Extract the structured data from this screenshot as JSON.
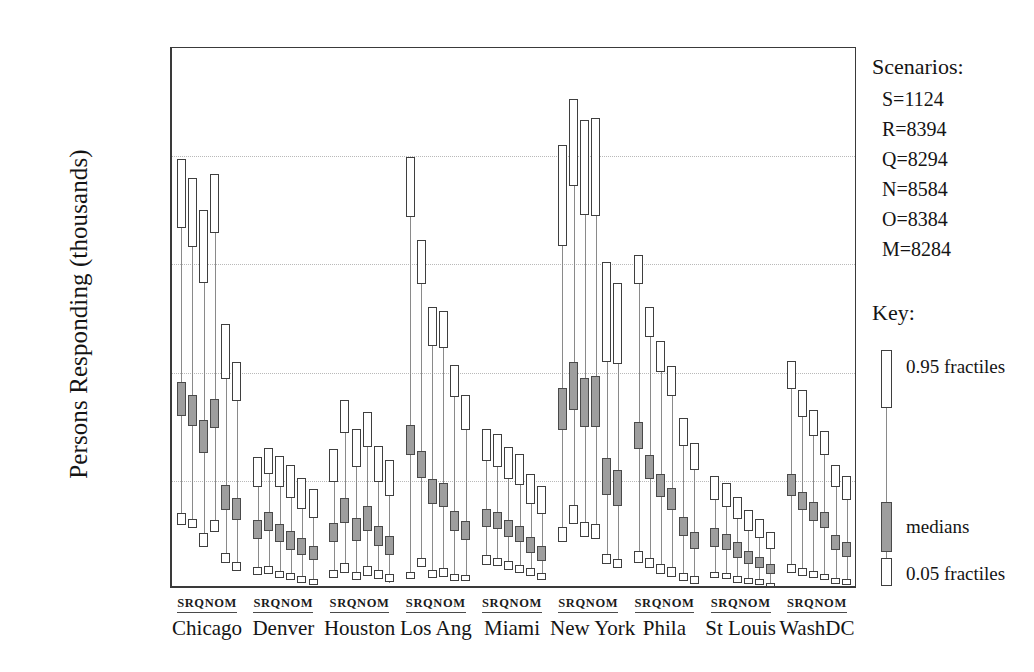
{
  "chart_data": {
    "type": "box",
    "title": "",
    "xlabel": "",
    "ylabel": "Persons Responding (thousands)",
    "ylim": [
      0,
      50
    ],
    "yticks": [
      0,
      10,
      20,
      30,
      40,
      50
    ],
    "gridlines": [
      10,
      20,
      30,
      40
    ],
    "grid": true,
    "legend_position": "right",
    "scenario_codes": [
      "S",
      "R",
      "Q",
      "N",
      "O",
      "M"
    ],
    "categories": [
      "Chicago",
      "Denver",
      "Houston",
      "Los Ang",
      "Miami",
      "New York",
      "Phila",
      "St Louis",
      "WashDC"
    ],
    "value_keys": [
      "p05_low",
      "p05_high",
      "median_low",
      "median_high",
      "p95_low",
      "p95_high"
    ],
    "series": [
      {
        "name": "Chicago",
        "points": [
          {
            "scenario": "S",
            "p05_low": 5.9,
            "p05_high": 7.0,
            "median_low": 16.0,
            "median_high": 19.1,
            "p95_low": 33.4,
            "p95_high": 39.7
          },
          {
            "scenario": "R",
            "p05_low": 5.6,
            "p05_high": 6.5,
            "median_low": 15.1,
            "median_high": 17.9,
            "p95_low": 31.6,
            "p95_high": 38.0
          },
          {
            "scenario": "Q",
            "p05_low": 3.9,
            "p05_high": 5.2,
            "median_low": 12.6,
            "median_high": 15.6,
            "p95_low": 28.3,
            "p95_high": 35.0
          },
          {
            "scenario": "N",
            "p05_low": 5.3,
            "p05_high": 6.4,
            "median_low": 14.9,
            "median_high": 17.6,
            "p95_low": 32.9,
            "p95_high": 38.4
          },
          {
            "scenario": "O",
            "p05_low": 2.4,
            "p05_high": 3.3,
            "median_low": 7.3,
            "median_high": 9.6,
            "p95_low": 19.4,
            "p95_high": 24.5
          },
          {
            "scenario": "M",
            "p05_low": 1.7,
            "p05_high": 2.5,
            "median_low": 6.4,
            "median_high": 8.4,
            "p95_low": 17.4,
            "p95_high": 21.0
          }
        ]
      },
      {
        "name": "Denver",
        "points": [
          {
            "scenario": "S",
            "p05_low": 1.3,
            "p05_high": 2.0,
            "median_low": 4.6,
            "median_high": 6.4,
            "p95_low": 9.4,
            "p95_high": 12.2
          },
          {
            "scenario": "R",
            "p05_low": 1.4,
            "p05_high": 2.1,
            "median_low": 5.4,
            "median_high": 7.1,
            "p95_low": 10.6,
            "p95_high": 13.0
          },
          {
            "scenario": "Q",
            "p05_low": 1.0,
            "p05_high": 1.7,
            "median_low": 4.3,
            "median_high": 6.0,
            "p95_low": 9.4,
            "p95_high": 12.3
          },
          {
            "scenario": "N",
            "p05_low": 0.8,
            "p05_high": 1.5,
            "median_low": 3.6,
            "median_high": 5.4,
            "p95_low": 8.4,
            "p95_high": 11.5
          },
          {
            "scenario": "O",
            "p05_low": 0.6,
            "p05_high": 1.2,
            "median_low": 3.1,
            "median_high": 4.7,
            "p95_low": 7.4,
            "p95_high": 10.3
          },
          {
            "scenario": "M",
            "p05_low": 0.4,
            "p05_high": 0.9,
            "median_low": 2.7,
            "median_high": 4.0,
            "p95_low": 6.6,
            "p95_high": 9.2
          }
        ]
      },
      {
        "name": "Houston",
        "points": [
          {
            "scenario": "S",
            "p05_low": 1.0,
            "p05_high": 1.8,
            "median_low": 4.3,
            "median_high": 6.1,
            "p95_low": 9.9,
            "p95_high": 12.9
          },
          {
            "scenario": "R",
            "p05_low": 1.5,
            "p05_high": 2.4,
            "median_low": 6.1,
            "median_high": 8.4,
            "p95_low": 14.4,
            "p95_high": 17.5
          },
          {
            "scenario": "Q",
            "p05_low": 0.8,
            "p05_high": 1.6,
            "median_low": 4.4,
            "median_high": 6.6,
            "p95_low": 11.3,
            "p95_high": 14.8
          },
          {
            "scenario": "N",
            "p05_low": 1.2,
            "p05_high": 2.1,
            "median_low": 5.4,
            "median_high": 7.7,
            "p95_low": 13.1,
            "p95_high": 16.4
          },
          {
            "scenario": "O",
            "p05_low": 0.9,
            "p05_high": 1.8,
            "median_low": 4.0,
            "median_high": 5.8,
            "p95_low": 9.9,
            "p95_high": 13.2
          },
          {
            "scenario": "M",
            "p05_low": 0.6,
            "p05_high": 1.4,
            "median_low": 3.1,
            "median_high": 4.9,
            "p95_low": 8.6,
            "p95_high": 11.9
          }
        ]
      },
      {
        "name": "Los Ang",
        "points": [
          {
            "scenario": "S",
            "p05_low": 0.9,
            "p05_high": 1.6,
            "median_low": 12.4,
            "median_high": 15.2,
            "p95_low": 34.4,
            "p95_high": 39.9
          },
          {
            "scenario": "R",
            "p05_low": 2.0,
            "p05_high": 2.9,
            "median_low": 10.3,
            "median_high": 12.8,
            "p95_low": 28.2,
            "p95_high": 32.3
          },
          {
            "scenario": "Q",
            "p05_low": 1.0,
            "p05_high": 1.8,
            "median_low": 7.9,
            "median_high": 10.2,
            "p95_low": 22.5,
            "p95_high": 26.1
          },
          {
            "scenario": "N",
            "p05_low": 1.1,
            "p05_high": 1.9,
            "median_low": 7.6,
            "median_high": 9.8,
            "p95_low": 22.3,
            "p95_high": 25.7
          },
          {
            "scenario": "O",
            "p05_low": 0.7,
            "p05_high": 1.4,
            "median_low": 5.4,
            "median_high": 7.2,
            "p95_low": 17.7,
            "p95_high": 20.7
          },
          {
            "scenario": "M",
            "p05_low": 0.7,
            "p05_high": 1.3,
            "median_low": 4.5,
            "median_high": 6.3,
            "p95_low": 14.7,
            "p95_high": 17.9
          }
        ]
      },
      {
        "name": "Miami",
        "points": [
          {
            "scenario": "S",
            "p05_low": 2.2,
            "p05_high": 3.1,
            "median_low": 5.7,
            "median_high": 7.4,
            "p95_low": 11.8,
            "p95_high": 14.8
          },
          {
            "scenario": "R",
            "p05_low": 2.1,
            "p05_high": 2.9,
            "median_low": 5.5,
            "median_high": 7.1,
            "p95_low": 11.3,
            "p95_high": 14.3
          },
          {
            "scenario": "Q",
            "p05_low": 1.8,
            "p05_high": 2.6,
            "median_low": 4.8,
            "median_high": 6.4,
            "p95_low": 10.2,
            "p95_high": 13.1
          },
          {
            "scenario": "N",
            "p05_low": 1.5,
            "p05_high": 2.2,
            "median_low": 4.3,
            "median_high": 5.8,
            "p95_low": 9.6,
            "p95_high": 12.5
          },
          {
            "scenario": "O",
            "p05_low": 1.2,
            "p05_high": 1.9,
            "median_low": 3.3,
            "median_high": 4.8,
            "p95_low": 7.9,
            "p95_high": 10.6
          },
          {
            "scenario": "M",
            "p05_low": 0.8,
            "p05_high": 1.5,
            "median_low": 2.6,
            "median_high": 4.0,
            "p95_low": 6.9,
            "p95_high": 9.5
          }
        ]
      },
      {
        "name": "New York",
        "points": [
          {
            "scenario": "S",
            "p05_low": 4.3,
            "p05_high": 5.7,
            "median_low": 14.7,
            "median_high": 18.6,
            "p95_low": 31.7,
            "p95_high": 41.0
          },
          {
            "scenario": "R",
            "p05_low": 6.0,
            "p05_high": 7.8,
            "median_low": 16.5,
            "median_high": 21.0,
            "p95_low": 37.2,
            "p95_high": 45.3
          },
          {
            "scenario": "Q",
            "p05_low": 4.8,
            "p05_high": 6.2,
            "median_low": 15.0,
            "median_high": 19.5,
            "p95_low": 34.6,
            "p95_high": 43.3
          },
          {
            "scenario": "N",
            "p05_low": 4.6,
            "p05_high": 6.0,
            "median_low": 15.0,
            "median_high": 19.7,
            "p95_low": 34.5,
            "p95_high": 43.5
          },
          {
            "scenario": "O",
            "p05_low": 2.3,
            "p05_high": 3.2,
            "median_low": 8.7,
            "median_high": 12.1,
            "p95_low": 21.0,
            "p95_high": 30.2
          },
          {
            "scenario": "M",
            "p05_low": 1.9,
            "p05_high": 2.8,
            "median_low": 7.7,
            "median_high": 11.0,
            "p95_low": 20.8,
            "p95_high": 28.3
          }
        ]
      },
      {
        "name": "Phila",
        "points": [
          {
            "scenario": "S",
            "p05_low": 2.4,
            "p05_high": 3.5,
            "median_low": 12.9,
            "median_high": 15.4,
            "p95_low": 28.2,
            "p95_high": 30.9
          },
          {
            "scenario": "R",
            "p05_low": 1.9,
            "p05_high": 2.9,
            "median_low": 10.2,
            "median_high": 12.4,
            "p95_low": 23.3,
            "p95_high": 26.1
          },
          {
            "scenario": "Q",
            "p05_low": 1.4,
            "p05_high": 2.3,
            "median_low": 8.5,
            "median_high": 10.6,
            "p95_low": 20.1,
            "p95_high": 22.9
          },
          {
            "scenario": "N",
            "p05_low": 1.1,
            "p05_high": 2.0,
            "median_low": 7.3,
            "median_high": 9.3,
            "p95_low": 17.8,
            "p95_high": 20.6
          },
          {
            "scenario": "O",
            "p05_low": 0.7,
            "p05_high": 1.5,
            "median_low": 4.9,
            "median_high": 6.7,
            "p95_low": 13.2,
            "p95_high": 15.8
          },
          {
            "scenario": "M",
            "p05_low": 0.5,
            "p05_high": 1.2,
            "median_low": 3.7,
            "median_high": 5.3,
            "p95_low": 11.0,
            "p95_high": 13.5
          }
        ]
      },
      {
        "name": "St Louis",
        "points": [
          {
            "scenario": "S",
            "p05_low": 1.0,
            "p05_high": 1.6,
            "median_low": 3.9,
            "median_high": 5.6,
            "p95_low": 8.2,
            "p95_high": 10.4
          },
          {
            "scenario": "R",
            "p05_low": 0.9,
            "p05_high": 1.5,
            "median_low": 3.6,
            "median_high": 5.1,
            "p95_low": 7.6,
            "p95_high": 9.8
          },
          {
            "scenario": "Q",
            "p05_low": 0.6,
            "p05_high": 1.2,
            "median_low": 2.9,
            "median_high": 4.3,
            "p95_low": 6.5,
            "p95_high": 8.5
          },
          {
            "scenario": "N",
            "p05_low": 0.5,
            "p05_high": 1.0,
            "median_low": 2.3,
            "median_high": 3.5,
            "p95_low": 5.4,
            "p95_high": 7.3
          },
          {
            "scenario": "O",
            "p05_low": 0.4,
            "p05_high": 0.9,
            "median_low": 1.9,
            "median_high": 3.0,
            "p95_low": 4.7,
            "p95_high": 6.5
          },
          {
            "scenario": "M",
            "p05_low": 0.2,
            "p05_high": 0.6,
            "median_low": 1.4,
            "median_high": 2.3,
            "p95_low": 3.7,
            "p95_high": 5.3
          }
        ]
      },
      {
        "name": "WashDC",
        "points": [
          {
            "scenario": "S",
            "p05_low": 1.5,
            "p05_high": 2.3,
            "median_low": 8.6,
            "median_high": 10.6,
            "p95_low": 18.5,
            "p95_high": 21.1
          },
          {
            "scenario": "R",
            "p05_low": 1.2,
            "p05_high": 1.9,
            "median_low": 7.3,
            "median_high": 9.0,
            "p95_low": 15.9,
            "p95_high": 18.4
          },
          {
            "scenario": "Q",
            "p05_low": 1.0,
            "p05_high": 1.7,
            "median_low": 6.3,
            "median_high": 8.0,
            "p95_low": 14.1,
            "p95_high": 16.5
          },
          {
            "scenario": "N",
            "p05_low": 0.8,
            "p05_high": 1.4,
            "median_low": 5.6,
            "median_high": 7.1,
            "p95_low": 12.4,
            "p95_high": 14.6
          },
          {
            "scenario": "O",
            "p05_low": 0.5,
            "p05_high": 1.0,
            "median_low": 3.6,
            "median_high": 5.0,
            "p95_low": 9.4,
            "p95_high": 11.5
          },
          {
            "scenario": "M",
            "p05_low": 0.4,
            "p05_high": 0.9,
            "median_low": 3.0,
            "median_high": 4.3,
            "p95_low": 8.2,
            "p95_high": 10.4
          }
        ]
      }
    ]
  },
  "axis": {
    "y_title": "Persons Responding (thousands)",
    "y_labels": [
      "50",
      "40",
      "30",
      "20",
      "10",
      "0"
    ]
  },
  "scenarios_legend": {
    "title": "Scenarios:",
    "items": [
      "S=1124",
      "R=8394",
      "Q=8294",
      "N=8584",
      "O=8384",
      "M=8284"
    ]
  },
  "key": {
    "title": "Key:",
    "upper_label": "0.95 fractiles",
    "middle_label": "medians",
    "lower_label": "0.05 fractiles"
  },
  "colors": {
    "box_fill": "#ffffff",
    "box_stroke": "#3f3f3f",
    "median_fill": "#9e9e9e",
    "stem": "#8a8a8a",
    "axis": "#3a3a3a",
    "grid": "#b9b9b9",
    "text": "#141414"
  }
}
